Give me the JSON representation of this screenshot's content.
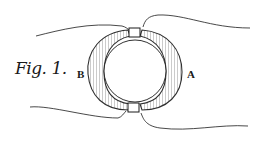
{
  "figure": {
    "label": "Fig. 1.",
    "parts": [
      {
        "id": "B",
        "label": "B",
        "side": "left"
      },
      {
        "id": "A",
        "label": "A",
        "side": "right"
      }
    ],
    "ink_color": "#1a1a1a",
    "background": "#ffffff"
  }
}
